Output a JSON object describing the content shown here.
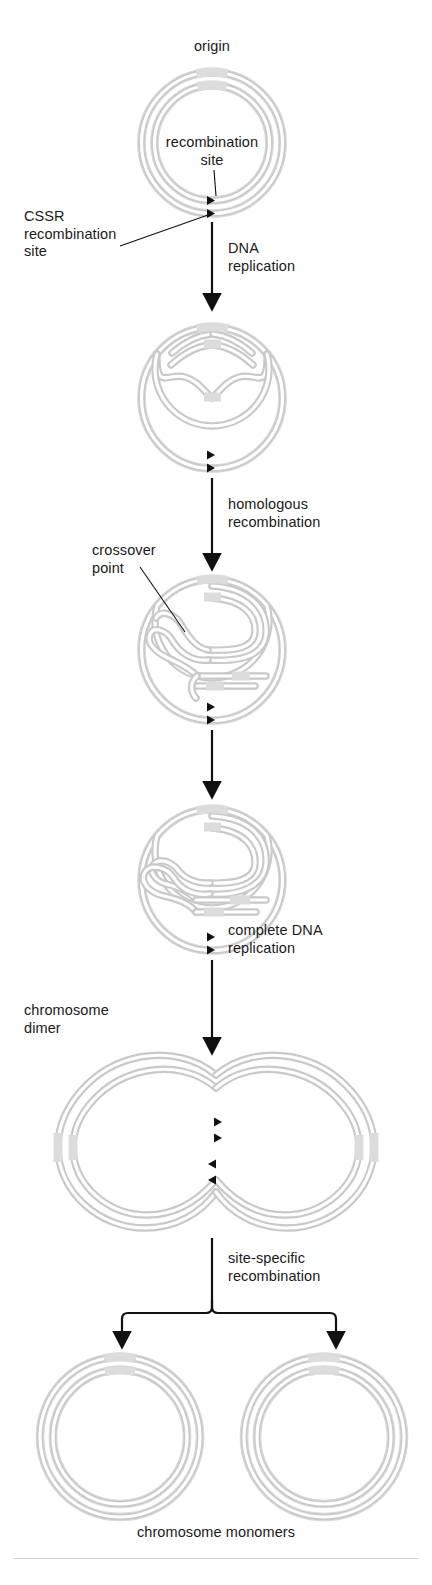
{
  "figure": {
    "domain": "Diagram",
    "background_color": "#ffffff",
    "dna_color": "#c9c9c9",
    "origin_band_color": "#dcdcdc",
    "arrow_color": "#111111",
    "text_color": "#1a1a1a"
  },
  "labels": {
    "origin": "origin",
    "recombination_site": "recombination\nsite",
    "cssr": "CSSR\nrecombination\nsite",
    "crossover_point": "crossover\npoint",
    "chromosome_dimer": "chromosome\ndimer",
    "chromosome_monomers": "chromosome monomers"
  },
  "steps": [
    {
      "id": "dna-replication",
      "label": "DNA\nreplication"
    },
    {
      "id": "homologous-recombination",
      "label": "homologous\nrecombination"
    },
    {
      "id": "unlabeled-step",
      "label": ""
    },
    {
      "id": "complete-dna-replication",
      "label": "complete DNA\nreplication"
    },
    {
      "id": "site-specific-recombination",
      "label": "site-specific\nrecombination"
    }
  ],
  "stages": [
    {
      "id": "stage-1-monomer-circle",
      "name": "circular chromosome with origin and recombination site"
    },
    {
      "id": "stage-2-replication-bubble",
      "name": "partially replicated theta structure"
    },
    {
      "id": "stage-3-crossover",
      "name": "crossover point / Holliday junction intermediate"
    },
    {
      "id": "stage-4-resolved-crossover",
      "name": "post-crossover replicating chromosome"
    },
    {
      "id": "stage-5-chromosome-dimer",
      "name": "figure-eight chromosome dimer"
    },
    {
      "id": "stage-6-chromosome-monomers",
      "name": "two separated chromosome monomers"
    }
  ],
  "markers": {
    "cssr_site_marker": "left-pointing triangle",
    "count_stage1": 2,
    "count_stage2": 2,
    "count_stage3": 2,
    "count_stage4": 2,
    "count_stage5": 4
  }
}
